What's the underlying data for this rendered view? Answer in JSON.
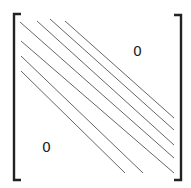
{
  "diagram": {
    "upper_label": "0",
    "lower_label": "0",
    "colors": {
      "bracket": "#222222",
      "band_line": "#555555",
      "text": "#222222"
    },
    "left_bracket": {
      "x": 14,
      "top": 14,
      "bottom": 180,
      "serif": 7
    },
    "right_bracket": {
      "x": 181,
      "top": 15,
      "bottom": 180,
      "serif": 7
    },
    "band_lines": [
      {
        "x1": 37,
        "y1": 21,
        "x2": 174,
        "y2": 145
      },
      {
        "x1": 50,
        "y1": 19,
        "x2": 174,
        "y2": 130
      },
      {
        "x1": 65,
        "y1": 21,
        "x2": 174,
        "y2": 118
      },
      {
        "x1": 20,
        "y1": 22,
        "x2": 174,
        "y2": 158
      },
      {
        "x1": 21,
        "y1": 41,
        "x2": 174,
        "y2": 173
      },
      {
        "x1": 21,
        "y1": 56,
        "x2": 143,
        "y2": 173
      },
      {
        "x1": 21,
        "y1": 71,
        "x2": 125,
        "y2": 173
      }
    ]
  }
}
